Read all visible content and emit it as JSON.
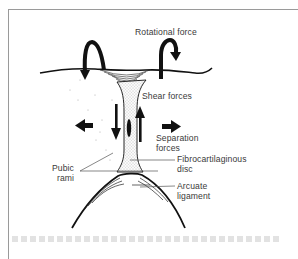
{
  "figure": {
    "labels": {
      "rotational": "Rotational force",
      "shear": "Shear forces",
      "separation_line1": "Separation",
      "separation_line2": "forces",
      "pubic_line1": "Pubic",
      "pubic_line2": "rami",
      "disc_line1": "Fibrocartilaginous",
      "disc_line2": "disc",
      "arcuate_line1": "Arcuate",
      "arcuate_line2": "ligament"
    },
    "colors": {
      "ink": "#111111",
      "label": "#3a3a3a",
      "frame": "#9a9a9a",
      "stipple": "#8a8a8a"
    },
    "icons": [
      "rotation-arrow-left-icon",
      "rotation-arrow-right-icon",
      "shear-arrow-down-icon",
      "shear-arrow-up-icon",
      "separation-arrow-left-icon",
      "separation-arrow-right-icon"
    ]
  }
}
